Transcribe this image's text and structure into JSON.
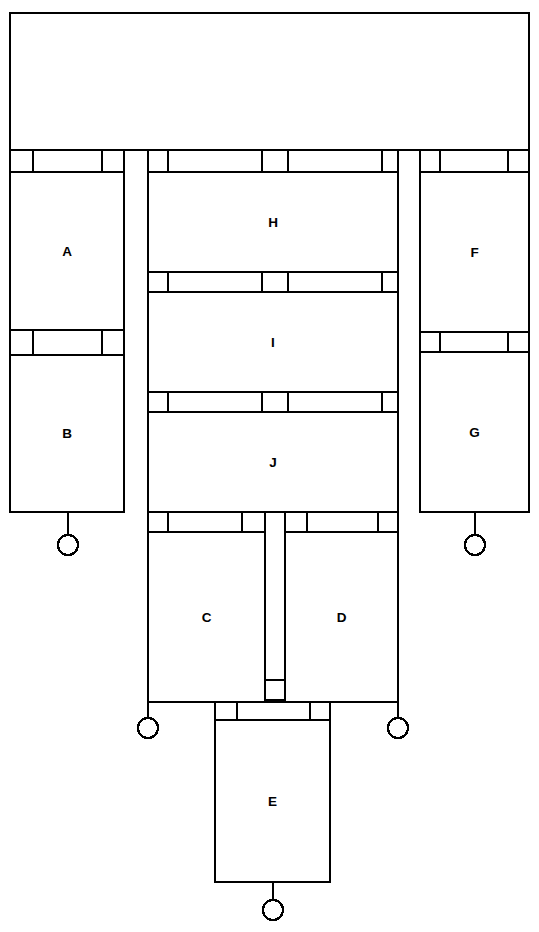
{
  "diagram": {
    "type": "block-schematic",
    "title": "",
    "stroke_color": "#000000",
    "fill_color": "#ffffff",
    "canvas": {
      "width": 539,
      "height": 932
    },
    "blocks": [
      {
        "id": "top",
        "label": "",
        "x": 10,
        "y": 13,
        "w": 519,
        "h": 137
      },
      {
        "id": "A",
        "label": "A",
        "x": 10,
        "y": 172,
        "w": 114,
        "h": 158
      },
      {
        "id": "B",
        "label": "B",
        "x": 10,
        "y": 355,
        "w": 114,
        "h": 157
      },
      {
        "id": "H",
        "label": "H",
        "x": 148,
        "y": 172,
        "w": 250,
        "h": 100
      },
      {
        "id": "I",
        "label": "I",
        "x": 148,
        "y": 292,
        "w": 250,
        "h": 100
      },
      {
        "id": "J",
        "label": "J",
        "x": 148,
        "y": 412,
        "w": 250,
        "h": 100
      },
      {
        "id": "C",
        "label": "C",
        "x": 148,
        "y": 532,
        "w": 117,
        "h": 170
      },
      {
        "id": "D",
        "label": "D",
        "x": 285,
        "y": 532,
        "w": 113,
        "h": 170
      },
      {
        "id": "E",
        "label": "E",
        "x": 215,
        "y": 720,
        "w": 115,
        "h": 162
      },
      {
        "id": "F",
        "label": "F",
        "x": 420,
        "y": 172,
        "w": 109,
        "h": 160
      },
      {
        "id": "G",
        "label": "G",
        "x": 420,
        "y": 352,
        "w": 109,
        "h": 160
      }
    ],
    "connector_bands": [
      {
        "id": "band-top-left",
        "x": 10,
        "y": 150,
        "w": 114,
        "h": 22,
        "dividers": [
          33,
          102
        ]
      },
      {
        "id": "band-top-mid",
        "x": 148,
        "y": 150,
        "w": 250,
        "h": 22,
        "dividers": [
          168,
          262,
          288,
          382
        ]
      },
      {
        "id": "band-top-right",
        "x": 420,
        "y": 150,
        "w": 109,
        "h": 22,
        "dividers": [
          440,
          508
        ]
      },
      {
        "id": "band-A-B",
        "x": 10,
        "y": 330,
        "w": 114,
        "h": 25,
        "dividers": [
          33,
          102
        ]
      },
      {
        "id": "band-H-I",
        "x": 148,
        "y": 272,
        "w": 250,
        "h": 20,
        "dividers": [
          168,
          262,
          288,
          382
        ]
      },
      {
        "id": "band-I-J",
        "x": 148,
        "y": 392,
        "w": 250,
        "h": 20,
        "dividers": [
          168,
          262,
          288,
          382
        ]
      },
      {
        "id": "band-J-C-left",
        "x": 148,
        "y": 512,
        "w": 117,
        "h": 20,
        "dividers": [
          168,
          242
        ]
      },
      {
        "id": "band-J-D-right",
        "x": 285,
        "y": 512,
        "w": 113,
        "h": 20,
        "dividers": [
          307,
          378
        ]
      },
      {
        "id": "band-F-G",
        "x": 420,
        "y": 332,
        "w": 109,
        "h": 20,
        "dividers": [
          440,
          508
        ]
      },
      {
        "id": "band-E-top",
        "x": 215,
        "y": 700,
        "w": 115,
        "h": 20,
        "dividers": [
          237,
          310
        ]
      }
    ],
    "vertical_channels": [
      {
        "id": "channel-left-outer",
        "x": 124,
        "y": 150,
        "h": 362
      },
      {
        "id": "channel-mid-left",
        "x": 148,
        "y": 150,
        "h": 362
      },
      {
        "id": "channel-right-inner",
        "x": 398,
        "y": 150,
        "h": 362
      },
      {
        "id": "channel-right-outer",
        "x": 420,
        "y": 150,
        "h": 362
      },
      {
        "id": "channel-cd-left",
        "x": 265,
        "y": 532,
        "h": 168
      },
      {
        "id": "channel-cd-right",
        "x": 285,
        "y": 532,
        "h": 168
      },
      {
        "id": "channel-left-leg",
        "x": 148,
        "y": 700,
        "h": 18
      },
      {
        "id": "channel-right-leg",
        "x": 398,
        "y": 700,
        "h": 18
      }
    ],
    "small_boxes": [
      {
        "id": "cd-junction-box",
        "x": 265,
        "y": 680,
        "w": 20,
        "h": 20
      }
    ],
    "rails": [
      {
        "id": "rail-cd-bottom",
        "x1": 148,
        "y1": 702,
        "x2": 398,
        "y2": 702
      }
    ],
    "terminals": [
      {
        "id": "terminal-B",
        "cx": 68,
        "cy": 545,
        "r": 10,
        "stem_from_y": 512
      },
      {
        "id": "terminal-G",
        "cx": 475,
        "cy": 545,
        "r": 10,
        "stem_from_y": 512
      },
      {
        "id": "terminal-C",
        "cx": 148,
        "cy": 728,
        "r": 10,
        "stem_from_y": 702
      },
      {
        "id": "terminal-D",
        "cx": 398,
        "cy": 728,
        "r": 10,
        "stem_from_y": 702
      },
      {
        "id": "terminal-E",
        "cx": 273,
        "cy": 910,
        "r": 10,
        "stem_from_y": 882
      }
    ]
  }
}
